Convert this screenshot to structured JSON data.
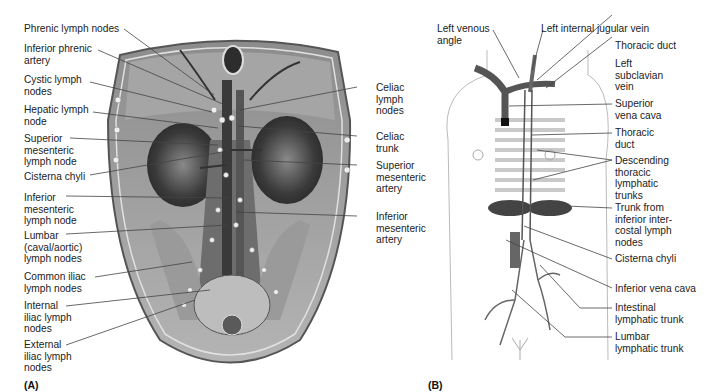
{
  "figure": {
    "panel_a": {
      "tag": "(A)",
      "description": "Abdominal lymph nodes, anterior view of posterior abdominal wall",
      "labels_left": [
        "Phrenic lymph nodes",
        "Inferior phrenic\nartery",
        "Cystic lymph\nnodes",
        "Hepatic lymph\nnode",
        "Superior\nmesenteric\nlymph node",
        "Cisterna chyli",
        "Inferior\nmesenteric\nlymph node",
        "Lumbar\n(caval/aortic)\nlymph nodes",
        "Common iliac\nlymph nodes",
        "Internal\niliac lymph\nnodes",
        "External\niliac lymph\nnodes"
      ],
      "labels_right": [
        "Celiac\nlymph\nnodes",
        "Celiac\ntrunk",
        "Superior\nmesenteric\nartery",
        "Inferior\nmesenteric\nartery"
      ]
    },
    "panel_b": {
      "tag": "(B)",
      "description": "Thoracic duct and lymphatic trunks",
      "labels_top": [
        "Left venous\nangle",
        "Left internal jugular vein"
      ],
      "labels_right": [
        "Thoracic duct",
        "Left\nsubclavian\nvein",
        "Superior\nvena cava",
        "Thoracic\nduct",
        "Descending\nthoracic\nlymphatic\ntrunks",
        "Trunk from\ninferior inter-\ncostal lymph\nnodes",
        "Cisterna chyli",
        "Inferior vena cava",
        "Intestinal\nlymphatic trunk",
        "Lumbar\nlymphatic trunk"
      ]
    },
    "colors": {
      "text": "#222222",
      "leader": "#444444",
      "background": "#ffffff",
      "illustration": "#6e6e6e"
    }
  }
}
